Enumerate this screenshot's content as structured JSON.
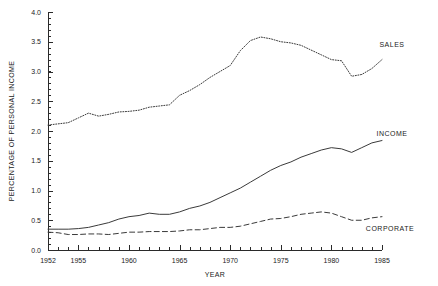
{
  "chart_data": {
    "type": "line",
    "title": "",
    "xlabel": "YEAR",
    "ylabel": "PERCENTAGE OF PERSONAL INCOME",
    "xlim": [
      1952,
      1985
    ],
    "ylim": [
      0.0,
      4.0
    ],
    "grid": false,
    "legend_position": "right-inline",
    "x_tick_labels": [
      "1952",
      "1955",
      "1960",
      "1965",
      "1970",
      "1975",
      "1980",
      "1985"
    ],
    "x_tick_values": [
      1952,
      1955,
      1960,
      1965,
      1970,
      1975,
      1980,
      1985
    ],
    "x_minor_step": 1,
    "y_tick_labels": [
      "0.0",
      "0.5",
      "1.0",
      "1.5",
      "2.0",
      "2.5",
      "3.0",
      "3.5",
      "4.0"
    ],
    "y_tick_values": [
      0.0,
      0.5,
      1.0,
      1.5,
      2.0,
      2.5,
      3.0,
      3.5,
      4.0
    ],
    "y_minor_step": 0.1,
    "x": [
      1952,
      1953,
      1954,
      1955,
      1956,
      1957,
      1958,
      1959,
      1960,
      1961,
      1962,
      1963,
      1964,
      1965,
      1966,
      1967,
      1968,
      1969,
      1970,
      1971,
      1972,
      1973,
      1974,
      1975,
      1976,
      1977,
      1978,
      1979,
      1980,
      1981,
      1982,
      1983,
      1984,
      1985
    ],
    "series": [
      {
        "name": "SALES",
        "style": "dotted",
        "color": "#3a3a3a",
        "values": [
          2.1,
          2.12,
          2.14,
          2.22,
          2.3,
          2.25,
          2.28,
          2.32,
          2.33,
          2.35,
          2.4,
          2.42,
          2.44,
          2.6,
          2.68,
          2.78,
          2.9,
          3.0,
          3.1,
          3.35,
          3.52,
          3.58,
          3.55,
          3.5,
          3.48,
          3.44,
          3.36,
          3.28,
          3.2,
          3.18,
          2.92,
          2.95,
          3.05,
          3.2
        ]
      },
      {
        "name": "INCOME",
        "style": "solid",
        "color": "#3a3a3a",
        "values": [
          0.35,
          0.35,
          0.35,
          0.36,
          0.38,
          0.42,
          0.46,
          0.52,
          0.56,
          0.58,
          0.62,
          0.6,
          0.6,
          0.64,
          0.7,
          0.74,
          0.8,
          0.88,
          0.96,
          1.04,
          1.14,
          1.24,
          1.34,
          1.42,
          1.48,
          1.56,
          1.62,
          1.68,
          1.72,
          1.7,
          1.64,
          1.72,
          1.8,
          1.84
        ]
      },
      {
        "name": "CORPORATE",
        "style": "dashed",
        "color": "#3a3a3a",
        "values": [
          0.3,
          0.29,
          0.26,
          0.26,
          0.27,
          0.27,
          0.26,
          0.28,
          0.3,
          0.3,
          0.31,
          0.31,
          0.31,
          0.32,
          0.34,
          0.34,
          0.36,
          0.38,
          0.38,
          0.4,
          0.44,
          0.48,
          0.52,
          0.53,
          0.56,
          0.6,
          0.62,
          0.64,
          0.62,
          0.56,
          0.5,
          0.5,
          0.54,
          0.56
        ]
      }
    ],
    "series_labels": [
      {
        "text": "SALES",
        "x": 392,
        "y": 47
      },
      {
        "text": "INCOME",
        "x": 392,
        "y": 136
      },
      {
        "text": "CORPORATE",
        "x": 390,
        "y": 231
      }
    ]
  }
}
